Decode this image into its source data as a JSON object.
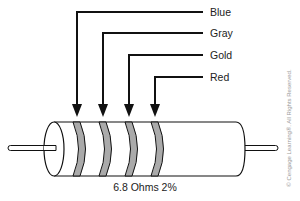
{
  "diagram": {
    "bands": [
      {
        "label": "Blue",
        "position": 1
      },
      {
        "label": "Gray",
        "position": 2
      },
      {
        "label": "Gold",
        "position": 3
      },
      {
        "label": "Red",
        "position": 4
      }
    ],
    "caption": "6.8 Ohms 2%",
    "copyright": "© Cengage Learning®. All Rights Reserved.",
    "colors": {
      "line": "#111111",
      "band_fill": "#aaaaaa",
      "body_fill": "#ffffff",
      "text": "#222222",
      "copyright_text": "#9a9a9a"
    }
  }
}
